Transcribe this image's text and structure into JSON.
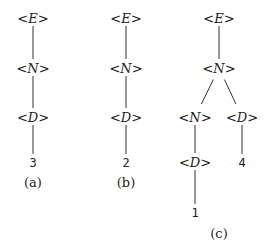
{
  "figures": [
    {
      "caption": "(a)",
      "nodes": [
        {
          "id": "a-E",
          "label": "<E>",
          "x": 33,
          "y": 18,
          "kind": "nonterminal"
        },
        {
          "id": "a-N",
          "label": "<N>",
          "x": 33,
          "y": 68,
          "kind": "nonterminal"
        },
        {
          "id": "a-D",
          "label": "<D>",
          "x": 33,
          "y": 117,
          "kind": "nonterminal"
        },
        {
          "id": "a-3",
          "label": "3",
          "x": 33,
          "y": 162,
          "kind": "terminal"
        }
      ],
      "edges": [
        [
          "a-E",
          "a-N"
        ],
        [
          "a-N",
          "a-D"
        ],
        [
          "a-D",
          "a-3"
        ]
      ],
      "caption_pos": {
        "x": 33,
        "y": 187
      }
    },
    {
      "caption": "(b)",
      "nodes": [
        {
          "id": "b-E",
          "label": "<E>",
          "x": 126,
          "y": 18,
          "kind": "nonterminal"
        },
        {
          "id": "b-N",
          "label": "<N>",
          "x": 126,
          "y": 68,
          "kind": "nonterminal"
        },
        {
          "id": "b-D",
          "label": "<D>",
          "x": 126,
          "y": 117,
          "kind": "nonterminal"
        },
        {
          "id": "b-2",
          "label": "2",
          "x": 126,
          "y": 162,
          "kind": "terminal"
        }
      ],
      "edges": [
        [
          "b-E",
          "b-N"
        ],
        [
          "b-N",
          "b-D"
        ],
        [
          "b-D",
          "b-2"
        ]
      ],
      "caption_pos": {
        "x": 126,
        "y": 187
      }
    },
    {
      "caption": "(c)",
      "nodes": [
        {
          "id": "c-E",
          "label": "<E>",
          "x": 219,
          "y": 18,
          "kind": "nonterminal"
        },
        {
          "id": "c-N",
          "label": "<N>",
          "x": 219,
          "y": 68,
          "kind": "nonterminal"
        },
        {
          "id": "c-N2",
          "label": "<N>",
          "x": 195,
          "y": 117,
          "kind": "nonterminal"
        },
        {
          "id": "c-D",
          "label": "<D>",
          "x": 242,
          "y": 117,
          "kind": "nonterminal"
        },
        {
          "id": "c-D2",
          "label": "<D>",
          "x": 195,
          "y": 162,
          "kind": "nonterminal"
        },
        {
          "id": "c-4",
          "label": "4",
          "x": 242,
          "y": 162,
          "kind": "terminal"
        },
        {
          "id": "c-1",
          "label": "1",
          "x": 195,
          "y": 212,
          "kind": "terminal"
        }
      ],
      "edges": [
        [
          "c-E",
          "c-N"
        ],
        [
          "c-N",
          "c-N2"
        ],
        [
          "c-N",
          "c-D"
        ],
        [
          "c-N2",
          "c-D2"
        ],
        [
          "c-D",
          "c-4"
        ],
        [
          "c-D2",
          "c-1"
        ]
      ],
      "caption_pos": {
        "x": 219,
        "y": 238
      }
    }
  ]
}
